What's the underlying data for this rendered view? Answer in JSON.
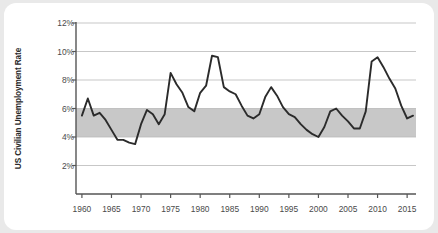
{
  "chart_data": {
    "type": "line",
    "title": "",
    "xlabel": "",
    "ylabel": "US Civilian Unemployment Rate",
    "xlim": [
      1959,
      2016.5
    ],
    "ylim": [
      0,
      12
    ],
    "grid": true,
    "legend": false,
    "y_tick_labels": [
      "2%",
      "4%",
      "6%",
      "8%",
      "10%",
      "12%"
    ],
    "y_tick_values": [
      2,
      4,
      6,
      8,
      10,
      12
    ],
    "x_tick_labels": [
      "1960",
      "1965",
      "1970",
      "1975",
      "1980",
      "1985",
      "1990",
      "1995",
      "2000",
      "2005",
      "2010",
      "2015"
    ],
    "x_tick_values": [
      1960,
      1965,
      1970,
      1975,
      1980,
      1985,
      1990,
      1995,
      2000,
      2005,
      2010,
      2015
    ],
    "shaded_band": {
      "label": "",
      "y_from": 4,
      "y_to": 6,
      "color": "#c8c8c8"
    },
    "line_color": "#2b2b2b",
    "series": [
      {
        "name": "US Civilian Unemployment Rate",
        "x": [
          1960,
          1961,
          1962,
          1963,
          1964,
          1965,
          1966,
          1967,
          1968,
          1969,
          1970,
          1971,
          1972,
          1973,
          1974,
          1975,
          1976,
          1977,
          1978,
          1979,
          1980,
          1981,
          1982,
          1983,
          1984,
          1985,
          1986,
          1987,
          1988,
          1989,
          1990,
          1991,
          1992,
          1993,
          1994,
          1995,
          1996,
          1997,
          1998,
          1999,
          2000,
          2001,
          2002,
          2003,
          2004,
          2005,
          2006,
          2007,
          2008,
          2009,
          2010,
          2011,
          2012,
          2013,
          2014,
          2015,
          2016
        ],
        "values": [
          5.5,
          6.7,
          5.5,
          5.7,
          5.2,
          4.5,
          3.8,
          3.8,
          3.6,
          3.5,
          4.9,
          5.9,
          5.6,
          4.9,
          5.6,
          8.5,
          7.7,
          7.1,
          6.1,
          5.8,
          7.1,
          7.6,
          9.7,
          9.6,
          7.5,
          7.2,
          7.0,
          6.2,
          5.5,
          5.3,
          5.6,
          6.8,
          7.5,
          6.9,
          6.1,
          5.6,
          5.4,
          4.9,
          4.5,
          4.2,
          4.0,
          4.7,
          5.8,
          6.0,
          5.5,
          5.1,
          4.6,
          4.6,
          5.8,
          9.3,
          9.6,
          8.9,
          8.1,
          7.4,
          6.2,
          5.3,
          5.5
        ],
        "units": "percent"
      }
    ]
  }
}
